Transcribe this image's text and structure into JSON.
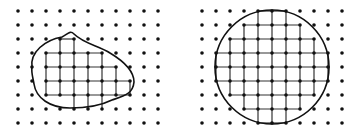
{
  "figure": {
    "colors": {
      "background": "#ffffff",
      "ink": "#111111",
      "grid": "#333333"
    },
    "dot_radius": 1.8,
    "left": {
      "name": "irregular-region",
      "cols_x": [
        18,
        32,
        46,
        60,
        74,
        88,
        102,
        116,
        130,
        144,
        158
      ],
      "rows_y": [
        11,
        25,
        39,
        53,
        67,
        81,
        95,
        109,
        123
      ],
      "boundary_path": "M 32,67 C 30,52 45,40 62,37 C 68,34 70,30 74,34 C 84,44 100,46 110,53 C 125,62 134,72 134,82 C 133,94 124,96 112,100 C 100,106 85,108 70,108 C 50,108 36,98 34,84 C 33,78 31,72 32,67 Z",
      "grid_rows": [
        {
          "y": 39,
          "x_from": 60,
          "x_to": 74
        },
        {
          "y": 53,
          "x_from": 46,
          "x_to": 102
        },
        {
          "y": 67,
          "x_from": 46,
          "x_to": 116
        },
        {
          "y": 81,
          "x_from": 46,
          "x_to": 130
        },
        {
          "y": 95,
          "x_from": 46,
          "x_to": 130
        }
      ],
      "grid_cols": [
        {
          "x": 46,
          "y_from": 53,
          "y_to": 95
        },
        {
          "x": 60,
          "y_from": 39,
          "y_to": 95
        },
        {
          "x": 74,
          "y_from": 39,
          "y_to": 109
        },
        {
          "x": 88,
          "y_from": 53,
          "y_to": 109
        },
        {
          "x": 102,
          "y_from": 53,
          "y_to": 109
        },
        {
          "x": 116,
          "y_from": 67,
          "y_to": 95
        },
        {
          "x": 130,
          "y_from": 81,
          "y_to": 95
        }
      ]
    },
    "right": {
      "name": "circle-region",
      "cols_x": [
        202,
        216,
        230,
        244,
        258,
        272,
        286,
        300,
        314,
        328,
        342
      ],
      "rows_y": [
        11,
        25,
        39,
        53,
        67,
        81,
        95,
        109,
        123
      ],
      "circle": {
        "cx": 272,
        "cy": 67,
        "r": 57
      },
      "grid_rows": [
        {
          "y": 11,
          "x_from": 258,
          "x_to": 286
        },
        {
          "y": 25,
          "x_from": 244,
          "x_to": 300
        },
        {
          "y": 39,
          "x_from": 230,
          "x_to": 314
        },
        {
          "y": 53,
          "x_from": 216,
          "x_to": 328
        },
        {
          "y": 67,
          "x_from": 216,
          "x_to": 328
        },
        {
          "y": 81,
          "x_from": 216,
          "x_to": 328
        },
        {
          "y": 95,
          "x_from": 230,
          "x_to": 314
        },
        {
          "y": 109,
          "x_from": 244,
          "x_to": 300
        },
        {
          "y": 123,
          "x_from": 258,
          "x_to": 286
        }
      ],
      "grid_cols": [
        {
          "x": 216,
          "y_from": 53,
          "y_to": 81
        },
        {
          "x": 230,
          "y_from": 39,
          "y_to": 95
        },
        {
          "x": 244,
          "y_from": 25,
          "y_to": 109
        },
        {
          "x": 258,
          "y_from": 11,
          "y_to": 123
        },
        {
          "x": 272,
          "y_from": 11,
          "y_to": 123
        },
        {
          "x": 286,
          "y_from": 11,
          "y_to": 123
        },
        {
          "x": 300,
          "y_from": 25,
          "y_to": 109
        },
        {
          "x": 314,
          "y_from": 39,
          "y_to": 95
        },
        {
          "x": 328,
          "y_from": 53,
          "y_to": 81
        }
      ]
    }
  }
}
